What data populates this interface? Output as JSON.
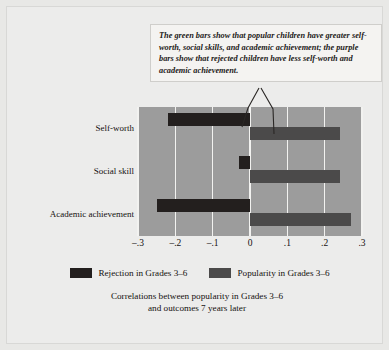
{
  "callout": {
    "text": "The green bars show that popular children have greater self-worth, social skills, and academic achievement; the purple bars show that rejected children have less self-worth and academic achievement."
  },
  "legend": {
    "items": [
      {
        "label": "Rejection in Grades 3–6",
        "color": "#231f1e",
        "swatch": "rejection-swatch"
      },
      {
        "label": "Popularity in Grades 3–6",
        "color": "#4b4a4a",
        "swatch": "popularity-swatch"
      }
    ]
  },
  "caption": {
    "line1": "Correlations between popularity in Grades 3–6",
    "line2": "and outcomes 7 years later"
  },
  "chart_data": {
    "type": "bar",
    "orientation": "horizontal",
    "title": "",
    "subtitle": "",
    "xlabel": "",
    "ylabel": "",
    "xlim": [
      -0.3,
      0.3
    ],
    "grid": true,
    "legend_position": "bottom",
    "categories": [
      "Self-worth",
      "Social skill",
      "Academic achievement"
    ],
    "tick_values": [
      -0.3,
      -0.2,
      -0.1,
      0,
      0.1,
      0.2,
      0.3
    ],
    "tick_labels": [
      "–.3",
      "–.2",
      "–.1",
      "0",
      ".1",
      ".2",
      ".3"
    ],
    "series": [
      {
        "name": "Rejection in Grades 3–6",
        "color": "#231f1e",
        "values": [
          -0.22,
          -0.03,
          -0.25
        ]
      },
      {
        "name": "Popularity in Grades 3–6",
        "color": "#4b4a4a",
        "values": [
          0.24,
          0.24,
          0.27
        ]
      }
    ]
  },
  "colors": {
    "plot_background": "#9c9c9c",
    "gridline": "#f2f2f0",
    "figure_background": "#ececeb",
    "page_background": "#e8e8e6",
    "callout_background": "#f4f3f1"
  }
}
